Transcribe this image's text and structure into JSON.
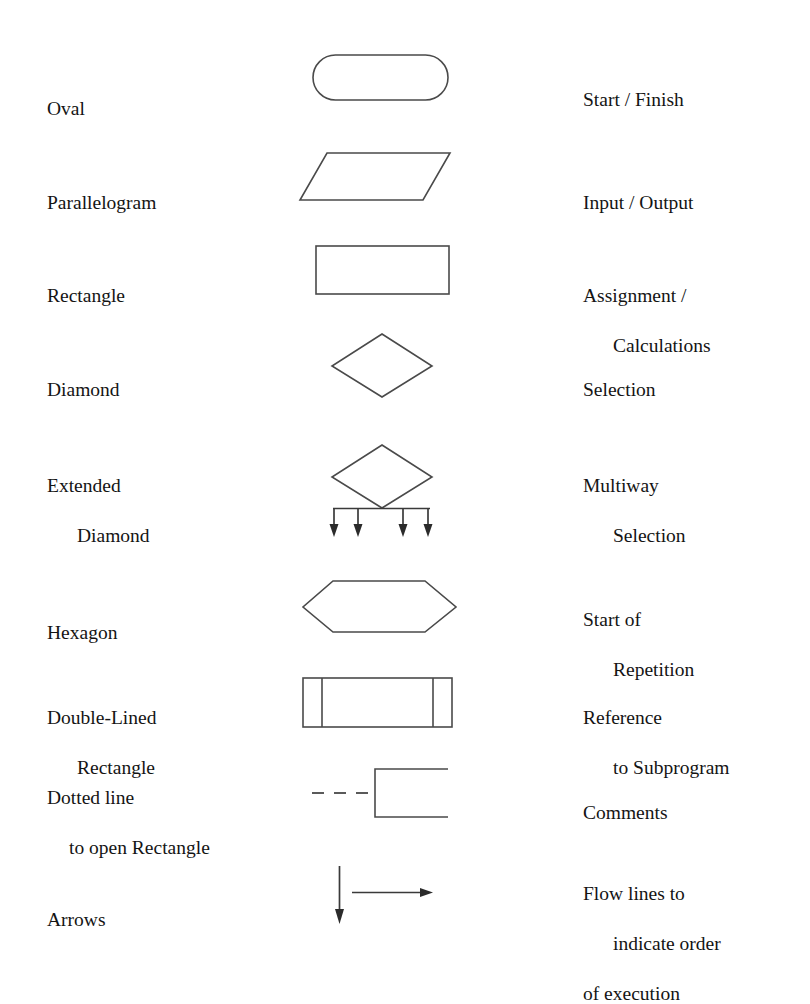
{
  "page": {
    "background_color": "#ffffff",
    "line_color": "#4a4a4a",
    "text_color": "#141414"
  },
  "columns": {
    "name_header": "Shape",
    "figure_header": "Symbol",
    "meaning_header": "Meaning"
  },
  "rows": [
    {
      "id": "oval",
      "name_lines": [
        "Oval"
      ],
      "meaning_lines": [
        "Start / Finish"
      ],
      "shape": "stadium"
    },
    {
      "id": "parallelogram",
      "name_lines": [
        "Parallelogram"
      ],
      "meaning_lines": [
        "Input / Output"
      ],
      "shape": "parallelogram"
    },
    {
      "id": "rectangle",
      "name_lines": [
        "Rectangle"
      ],
      "meaning_lines": [
        "Assignment /",
        "Calculations"
      ],
      "shape": "rectangle"
    },
    {
      "id": "diamond",
      "name_lines": [
        "Diamond"
      ],
      "meaning_lines": [
        "Selection"
      ],
      "shape": "diamond"
    },
    {
      "id": "extended-diamond",
      "name_lines": [
        "Extended",
        "Diamond"
      ],
      "meaning_lines": [
        "Multiway",
        "Selection"
      ],
      "shape": "extended-diamond"
    },
    {
      "id": "hexagon",
      "name_lines": [
        "Hexagon"
      ],
      "meaning_lines": [
        "Start of",
        "Repetition"
      ],
      "shape": "hexagon"
    },
    {
      "id": "double-lined-rectangle",
      "name_lines": [
        "Double-Lined",
        "Rectangle"
      ],
      "meaning_lines": [
        "Reference",
        "to Subprogram"
      ],
      "shape": "double-lined-rectangle"
    },
    {
      "id": "dotted-open-rectangle",
      "name_lines": [
        "Dotted line",
        "to open Rectangle"
      ],
      "meaning_lines": [
        "Comments"
      ],
      "shape": "dashed-open-rectangle"
    },
    {
      "id": "arrows",
      "name_lines": [
        "Arrows"
      ],
      "meaning_lines": [
        "Flow lines to",
        "indicate order",
        "of execution"
      ],
      "shape": "arrows"
    }
  ]
}
